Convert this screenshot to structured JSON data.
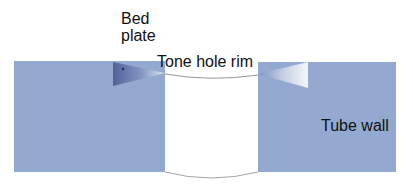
{
  "diagram": {
    "labels": {
      "bed_plate_line1": "Bed",
      "bed_plate_line2": "plate",
      "tone_hole_rim": "Tone hole rim",
      "tube_wall": "Tube wall"
    },
    "colors": {
      "tube_wall_fill": "#93a9d0",
      "bed_plate_dark": "#5a6e9e",
      "bed_plate_light": "#ffffff",
      "rim_stroke": "#8a8a8a",
      "background": "#ffffff"
    },
    "shapes": {
      "left_wall": {
        "x": 14,
        "y": 61,
        "width": 151,
        "height": 111
      },
      "right_wall": {
        "x": 258,
        "y": 62,
        "width": 138,
        "height": 110
      },
      "left_bed_plate": {
        "points": "113,62 165,73 113,86"
      },
      "right_bed_plate": {
        "points": "308,62 258,74 308,88"
      },
      "tone_hole_top_arc": "M165,74 Q211,82 258,75",
      "tone_hole_bottom_arc": "M165,172 Q211,184 258,172"
    }
  }
}
